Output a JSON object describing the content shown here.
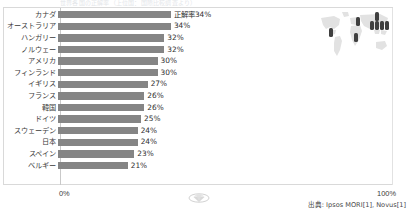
{
  "title_strip": "世界各国の正解率（上位国：国際比較調査より）",
  "chart_data": {
    "type": "bar",
    "title": "",
    "xlabel": "",
    "ylabel": "",
    "orientation": "horizontal",
    "xlim": [
      0,
      100
    ],
    "grid": false,
    "legend": "none",
    "value_suffix": "%",
    "first_value_label": "正解率34%",
    "categories": [
      "カナダ",
      "オーストラリア",
      "ハンガリー",
      "ノルウェー",
      "アメリカ",
      "フィンランド",
      "イギリス",
      "フランス",
      "韓国",
      "ドイツ",
      "スウェーデン",
      "日本",
      "スペイン",
      "ベルギー"
    ],
    "values": [
      34,
      34,
      32,
      32,
      30,
      30,
      27,
      26,
      26,
      25,
      24,
      24,
      23,
      21
    ],
    "value_labels": [
      "正解率34%",
      "34%",
      "32%",
      "32%",
      "30%",
      "30%",
      "27%",
      "26%",
      "26%",
      "25%",
      "24%",
      "24%",
      "23%",
      "21%"
    ],
    "bar_color": "#858585",
    "axis_ticks": [
      "0%",
      "100%"
    ]
  },
  "axis": {
    "left_tick": "0%",
    "right_tick": "100%"
  },
  "source": {
    "text": "出典: Ipsos MORI[1], Novus[1]"
  },
  "map": {
    "name": "world-map-illustration",
    "marker_count": 8
  },
  "colors": {
    "bar": "#858585",
    "frame": "#d9d9d9",
    "text": "#3a3a3a",
    "background": "#ffffff"
  }
}
